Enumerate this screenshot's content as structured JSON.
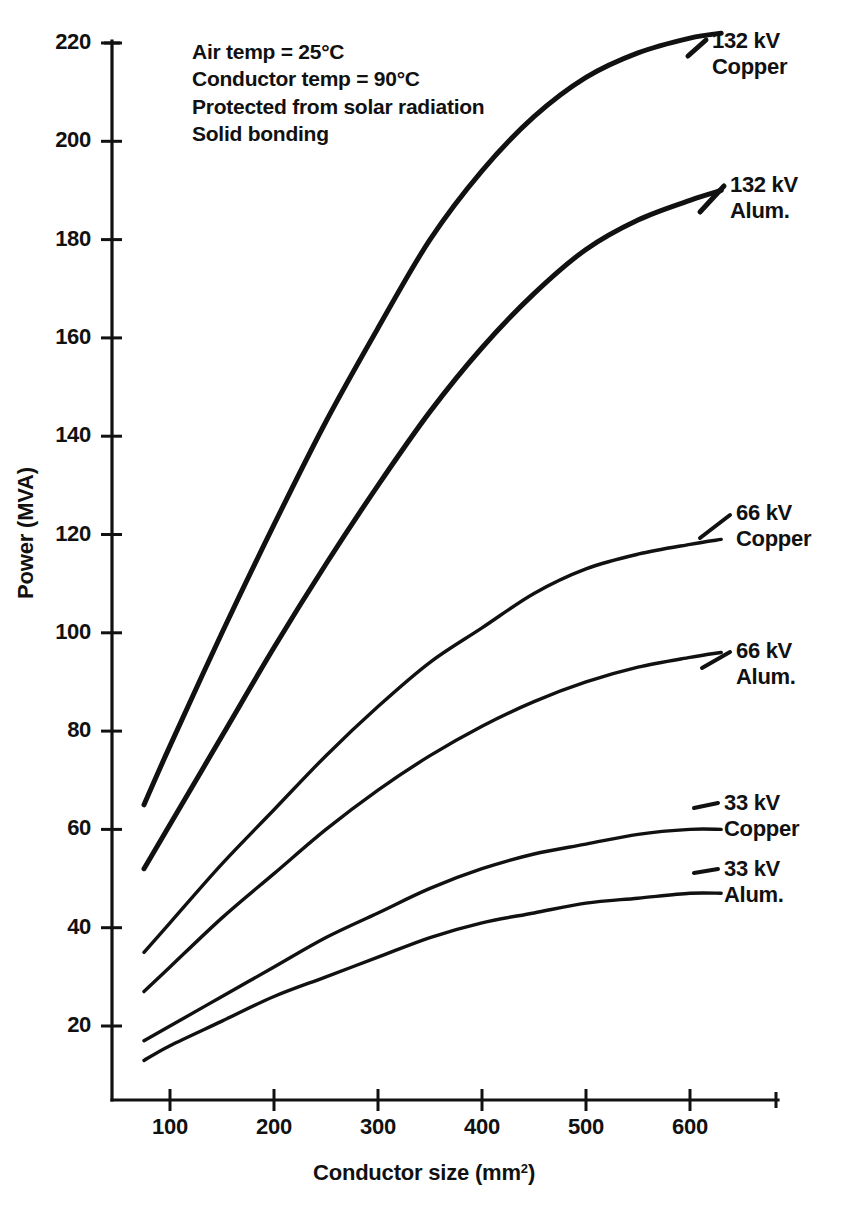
{
  "chart_data": {
    "type": "line",
    "title": "",
    "xlabel": "Conductor size (mm²)",
    "ylabel": "Power (MVA)",
    "xlim": [
      0,
      640
    ],
    "ylim": [
      0,
      230
    ],
    "xticks": [
      100,
      200,
      300,
      400,
      500,
      600
    ],
    "yticks": [
      20,
      40,
      60,
      80,
      100,
      120,
      140,
      160,
      180,
      200,
      220
    ],
    "grid": false,
    "legend_position": "right-of-curve-ends",
    "x": [
      75,
      100,
      150,
      200,
      250,
      300,
      350,
      400,
      450,
      500,
      550,
      600,
      630
    ],
    "series": [
      {
        "name": "132 kV Copper",
        "label_line1": "132 kV",
        "label_line2": "Copper",
        "values": [
          65,
          77,
          100,
          122,
          143,
          162,
          180,
          194,
          205,
          213,
          218,
          221,
          222
        ]
      },
      {
        "name": "132 kV Alum.",
        "label_line1": "132 kV",
        "label_line2": "Alum.",
        "values": [
          52,
          61,
          79,
          97,
          114,
          130,
          145,
          158,
          169,
          178,
          184,
          188,
          190
        ]
      },
      {
        "name": "66 kV Copper",
        "label_line1": "66 kV",
        "label_line2": "Copper",
        "values": [
          35,
          41,
          53,
          64,
          75,
          85,
          94,
          101,
          108,
          113,
          116,
          118,
          119
        ]
      },
      {
        "name": "66 kV Alum.",
        "label_line1": "66 kV",
        "label_line2": "Alum.",
        "values": [
          27,
          32,
          42,
          51,
          60,
          68,
          75,
          81,
          86,
          90,
          93,
          95,
          96
        ]
      },
      {
        "name": "33 kV Copper",
        "label_line1": "33 kV",
        "label_line2": "Copper",
        "values": [
          17,
          20,
          26,
          32,
          38,
          43,
          48,
          52,
          55,
          57,
          59,
          60,
          60
        ]
      },
      {
        "name": "33 kV Alum.",
        "label_line1": "33 kV",
        "label_line2": "Alum.",
        "values": [
          13,
          16,
          21,
          26,
          30,
          34,
          38,
          41,
          43,
          45,
          46,
          47,
          47
        ]
      }
    ]
  },
  "annotations": {
    "line1": "Air temp  =  25°C",
    "line2": "Conductor temp  =  90°C",
    "line3": "Protected from solar radiation",
    "line4": "Solid bonding"
  },
  "axis": {
    "x_title_text": "Conductor size (mm",
    "x_title_sup": "2",
    "x_title_tail": ")",
    "y_title": "Power (MVA)"
  },
  "colors": {
    "ink": "#111111",
    "paper": "#ffffff"
  }
}
